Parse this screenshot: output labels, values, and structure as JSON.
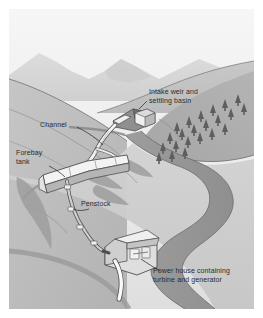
{
  "figure": {
    "style": "grayscale isometric landscape illustration",
    "frame": {
      "x": 9,
      "y": 9,
      "width": 245,
      "height": 300,
      "background": "#ffffff"
    }
  },
  "palette": {
    "page_background": "#ffffff",
    "sky_top": "#f2f2f2",
    "sky_bottom": "#dcdcdc",
    "far_mountain": "#d2d2d2",
    "mid_ridge": "#c4c4c4",
    "hill_light": "#c9c9c9",
    "hill_mid": "#b6b6b6",
    "hill_dark": "#a3a3a3",
    "valley_floor": "#cfcfcf",
    "river": "#9a9a9a",
    "river_edge": "#8a8a8a",
    "structure_white": "#f4f4f4",
    "structure_shadow": "#b0b0b0",
    "outline": "#5a5a5a",
    "label_text": "#2b2b2b",
    "leader_line": "#3a3a3a"
  },
  "labels": [
    {
      "id": "intake",
      "text_lines": [
        "Intake weir and",
        "settling basin"
      ],
      "x": 140,
      "y": 82,
      "align": "left"
    },
    {
      "id": "channel",
      "text_lines": [
        "Channel"
      ],
      "x": 40,
      "y": 116,
      "align": "left"
    },
    {
      "id": "forebay",
      "text_lines": [
        "Forebay",
        "tank"
      ],
      "x": 16,
      "y": 145,
      "align": "left"
    },
    {
      "id": "penstock",
      "text_lines": [
        "Penstock"
      ],
      "x": 81,
      "y": 196,
      "align": "left"
    },
    {
      "id": "powerhouse",
      "text_lines": [
        "Power house containing",
        "turbine and generator"
      ],
      "x": 153,
      "y": 260,
      "align": "left"
    }
  ],
  "components": [
    {
      "name": "intake-weir-and-settling-basin",
      "description": "weir box and settling basin on upper stream"
    },
    {
      "name": "channel",
      "description": "open channel conveying water along the hillside"
    },
    {
      "name": "forebay-tank",
      "description": "tank at the head of the penstock"
    },
    {
      "name": "penstock",
      "description": "pressure pipe descending the slope"
    },
    {
      "name": "power-house",
      "description": "building containing turbine and generator"
    },
    {
      "name": "tailrace",
      "description": "white discharge channel returning water to the river"
    },
    {
      "name": "river",
      "description": "meandering river through the valley"
    },
    {
      "name": "conifer-forest",
      "description": "rows of conifer trees on the right hillside"
    },
    {
      "name": "distant-mountains",
      "description": "pale mountain peaks on the horizon"
    }
  ]
}
